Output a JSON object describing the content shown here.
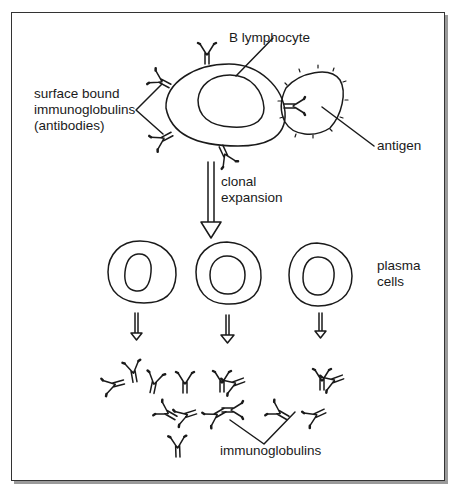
{
  "diagram": {
    "labels": {
      "b_lymphocyte": "B lymphocyte",
      "surface_line1": "surface bound",
      "surface_line2": "immunoglobulins",
      "surface_line3": "(antibodies)",
      "antigen": "antigen",
      "clonal_line1": "clonal",
      "clonal_line2": "expansion",
      "plasma_line1": "plasma",
      "plasma_line2": "cells",
      "immunoglobulins": "immunoglobulins"
    },
    "nodes": [
      "B lymphocyte",
      "antigen",
      "plasma cell 1",
      "plasma cell 2",
      "plasma cell 3",
      "immunoglobulins"
    ],
    "edges": [
      {
        "from": "B lymphocyte",
        "to": "plasma cells",
        "label": "clonal expansion"
      },
      {
        "from": "plasma cells",
        "to": "immunoglobulins"
      }
    ],
    "colors": {
      "stroke": "#1a1a1a",
      "frame": "#333333",
      "shadow": "#9a9a9a"
    }
  }
}
